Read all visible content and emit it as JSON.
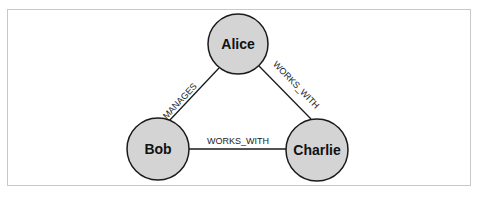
{
  "diagram": {
    "type": "graph",
    "nodes": [
      {
        "id": "alice",
        "label": "Alice"
      },
      {
        "id": "bob",
        "label": "Bob"
      },
      {
        "id": "charlie",
        "label": "Charlie"
      }
    ],
    "edges": [
      {
        "from": "alice",
        "to": "bob",
        "label": "MANAGES"
      },
      {
        "from": "alice",
        "to": "charlie",
        "label": "WORKS_WITH"
      },
      {
        "from": "bob",
        "to": "charlie",
        "label": "WORKS_WITH"
      }
    ],
    "colors": {
      "node_fill": "#d4d4d4",
      "node_stroke": "#1a1a1a",
      "edge_stroke": "#1a1a1a",
      "frame_border": "#c8c8c8"
    }
  }
}
